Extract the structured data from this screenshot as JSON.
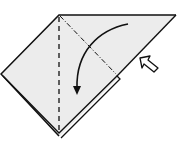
{
  "diagram": {
    "type": "origami-fold-step",
    "colors": {
      "paper": "#ececec",
      "outline": "#111111",
      "background": "#ffffff"
    },
    "elements": [
      {
        "name": "paper-shape",
        "kind": "quadrilateral"
      },
      {
        "name": "valley-fold-line",
        "kind": "dashed"
      },
      {
        "name": "mountain-fold-line",
        "kind": "dash-dot"
      },
      {
        "name": "fold-direction-arrow",
        "kind": "curved-arrow"
      },
      {
        "name": "push-arrow",
        "kind": "hollow-arrow"
      }
    ]
  }
}
